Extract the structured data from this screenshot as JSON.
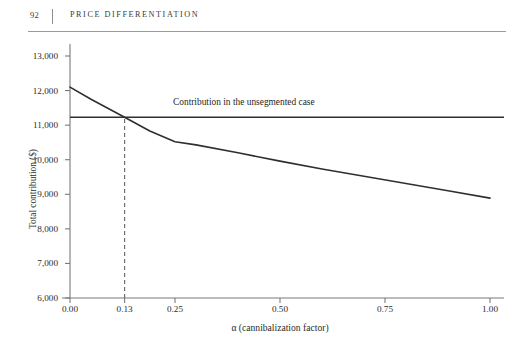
{
  "page": {
    "folio": "92",
    "running_title": "PRICE DIFFERENTIATION"
  },
  "chart_data": {
    "type": "line",
    "title": "",
    "xlabel": "α (cannibalization factor)",
    "ylabel": "Total contribution ($)",
    "xlim": [
      0.0,
      1.0
    ],
    "ylim": [
      6000,
      13000
    ],
    "grid": false,
    "legend_position": "inline-annotation",
    "xticks": [
      0.0,
      0.13,
      0.25,
      0.5,
      0.75,
      1.0
    ],
    "xtick_labels": [
      "0.00",
      "0.13",
      "0.25",
      "0.50",
      "0.75",
      "1.00"
    ],
    "yticks": [
      6000,
      7000,
      8000,
      9000,
      10000,
      11000,
      12000,
      13000
    ],
    "ytick_labels": [
      "6,000",
      "7,000",
      "8,000",
      "9,000",
      "10,000",
      "11,000",
      "12,000",
      "13,000"
    ],
    "series": [
      {
        "name": "Contribution in the segmented case",
        "style": "solid-curve",
        "x": [
          0.0,
          0.05,
          0.13,
          0.19,
          0.25,
          0.3,
          0.4,
          0.5,
          0.6,
          0.7,
          0.8,
          0.9,
          1.0
        ],
        "values": [
          12100,
          11750,
          11230,
          10830,
          10520,
          10430,
          10200,
          9960,
          9730,
          9520,
          9310,
          9100,
          8890
        ]
      },
      {
        "name": "Contribution in the unsegmented case",
        "style": "horizontal-line",
        "value": 11230
      }
    ],
    "annotations": [
      {
        "text": "Contribution in the unsegmented case",
        "x": 0.5,
        "y": 11600
      }
    ],
    "markers": [
      {
        "type": "vertical-dashed",
        "x": 0.13,
        "y_from": 6000,
        "y_to": 11230,
        "label": "0.13"
      }
    ],
    "colors": {
      "curve": "#2f2f2f",
      "reference_line": "#2f2f2f",
      "dashed_marker": "#6f6f6f",
      "axis": "#7a7a7a",
      "text": "#2b2b2b",
      "rule": "#9a9a9a"
    }
  }
}
